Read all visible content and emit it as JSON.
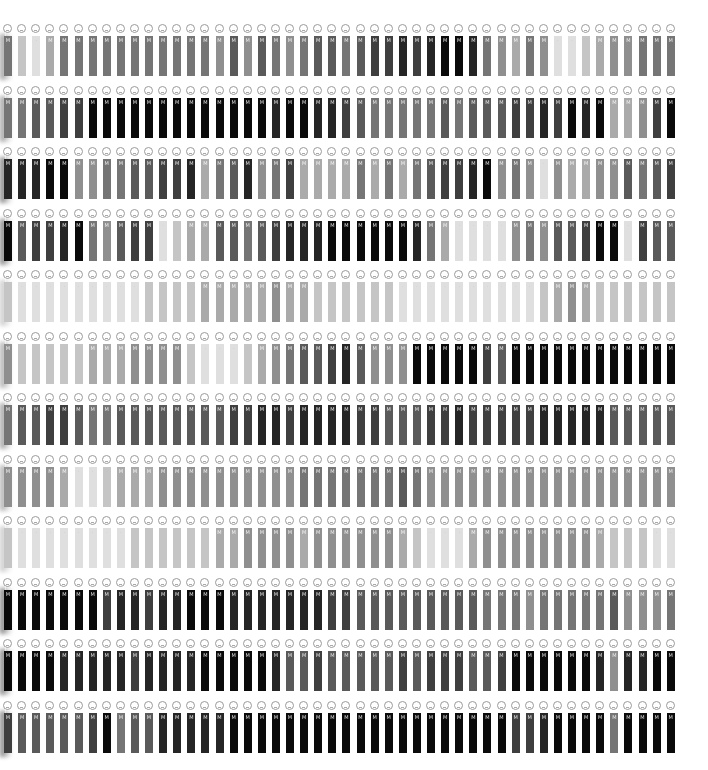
{
  "grid": {
    "rows": 12,
    "columns": 48,
    "column_pitch_px": 14.1,
    "row_pitch_px": 61.5,
    "first_column_x": 4,
    "first_row_y": 26,
    "glyph": "M",
    "face_icon": "face-icon",
    "shade_scale": "0 = white ... 9 = black",
    "shades": [
      [
        5,
        2,
        1,
        3,
        5,
        5,
        5,
        5,
        5,
        5,
        5,
        5,
        5,
        5,
        5,
        4,
        6,
        4,
        6,
        5,
        4,
        5,
        6,
        6,
        5,
        6,
        7,
        7,
        8,
        7,
        8,
        9,
        9,
        8,
        5,
        4,
        3,
        5,
        4,
        1,
        1,
        2,
        3,
        4,
        4,
        5,
        5,
        5
      ],
      [
        5,
        5,
        6,
        6,
        7,
        7,
        9,
        9,
        9,
        9,
        9,
        9,
        9,
        9,
        9,
        9,
        9,
        9,
        9,
        8,
        9,
        9,
        8,
        8,
        7,
        6,
        5,
        5,
        5,
        5,
        5,
        6,
        5,
        6,
        6,
        6,
        7,
        7,
        8,
        7,
        9,
        8,
        9,
        3,
        3,
        4,
        7,
        9
      ],
      [
        8,
        8,
        8,
        9,
        9,
        4,
        4,
        5,
        5,
        6,
        6,
        7,
        7,
        8,
        3,
        5,
        6,
        8,
        4,
        5,
        7,
        3,
        3,
        3,
        3,
        5,
        3,
        5,
        3,
        5,
        6,
        7,
        7,
        8,
        9,
        4,
        5,
        4,
        1,
        4,
        3,
        3,
        4,
        4,
        6,
        5,
        6,
        7
      ],
      [
        9,
        6,
        7,
        7,
        8,
        9,
        5,
        4,
        6,
        7,
        7,
        1,
        2,
        3,
        3,
        6,
        6,
        5,
        6,
        7,
        8,
        8,
        8,
        9,
        9,
        9,
        9,
        9,
        9,
        8,
        5,
        3,
        1,
        1,
        1,
        1,
        4,
        5,
        4,
        6,
        6,
        7,
        9,
        9,
        1,
        7,
        6,
        6
      ],
      [
        2,
        1,
        1,
        1,
        1,
        1,
        1,
        1,
        1,
        1,
        2,
        2,
        2,
        2,
        3,
        3,
        3,
        3,
        3,
        4,
        3,
        3,
        2,
        2,
        2,
        2,
        2,
        2,
        1,
        1,
        1,
        1,
        1,
        1,
        1,
        1,
        1,
        1,
        2,
        3,
        4,
        3,
        2,
        2,
        2,
        2,
        2,
        2
      ],
      [
        4,
        2,
        2,
        2,
        2,
        2,
        3,
        3,
        3,
        4,
        4,
        4,
        4,
        2,
        1,
        1,
        1,
        2,
        3,
        4,
        5,
        6,
        6,
        7,
        8,
        6,
        4,
        4,
        4,
        9,
        9,
        9,
        9,
        9,
        7,
        6,
        9,
        9,
        9,
        9,
        9,
        9,
        9,
        9,
        9,
        9,
        9,
        9
      ],
      [
        5,
        6,
        6,
        7,
        7,
        6,
        5,
        5,
        6,
        6,
        6,
        6,
        6,
        6,
        6,
        6,
        7,
        7,
        8,
        8,
        7,
        8,
        8,
        8,
        8,
        7,
        7,
        6,
        6,
        6,
        7,
        7,
        8,
        7,
        7,
        7,
        7,
        7,
        8,
        8,
        8,
        8,
        8,
        6,
        6,
        6,
        6,
        6
      ],
      [
        4,
        4,
        4,
        4,
        3,
        1,
        1,
        2,
        3,
        3,
        3,
        4,
        4,
        4,
        4,
        4,
        4,
        4,
        4,
        4,
        4,
        5,
        5,
        5,
        5,
        5,
        5,
        5,
        6,
        5,
        4,
        4,
        4,
        4,
        4,
        4,
        4,
        4,
        4,
        4,
        4,
        4,
        4,
        4,
        4,
        4,
        4,
        4
      ],
      [
        2,
        1,
        1,
        1,
        1,
        1,
        1,
        1,
        1,
        2,
        2,
        2,
        2,
        2,
        2,
        3,
        3,
        4,
        4,
        4,
        4,
        3,
        4,
        4,
        4,
        4,
        4,
        4,
        3,
        2,
        1,
        1,
        1,
        3,
        4,
        4,
        4,
        4,
        4,
        4,
        4,
        4,
        3,
        2,
        2,
        2,
        1,
        1
      ],
      [
        9,
        9,
        9,
        9,
        9,
        9,
        9,
        7,
        8,
        8,
        7,
        8,
        8,
        9,
        9,
        9,
        8,
        8,
        8,
        8,
        8,
        8,
        8,
        7,
        7,
        6,
        6,
        6,
        6,
        6,
        6,
        6,
        6,
        6,
        5,
        5,
        5,
        4,
        5,
        5,
        5,
        5,
        5,
        6,
        4,
        4,
        4,
        5
      ],
      [
        9,
        9,
        9,
        9,
        8,
        8,
        8,
        8,
        8,
        7,
        8,
        8,
        8,
        8,
        9,
        9,
        9,
        9,
        9,
        8,
        6,
        6,
        7,
        6,
        6,
        6,
        6,
        6,
        7,
        6,
        7,
        7,
        7,
        6,
        6,
        7,
        9,
        9,
        9,
        9,
        9,
        9,
        8,
        4,
        8,
        8,
        9,
        9
      ],
      [
        7,
        6,
        6,
        6,
        6,
        6,
        7,
        9,
        5,
        6,
        6,
        8,
        8,
        8,
        8,
        8,
        9,
        9,
        9,
        9,
        9,
        9,
        9,
        9,
        9,
        9,
        9,
        9,
        9,
        9,
        9,
        9,
        9,
        9,
        9,
        9,
        7,
        7,
        8,
        9,
        9,
        9,
        9,
        5,
        9,
        9,
        9,
        9
      ]
    ]
  }
}
